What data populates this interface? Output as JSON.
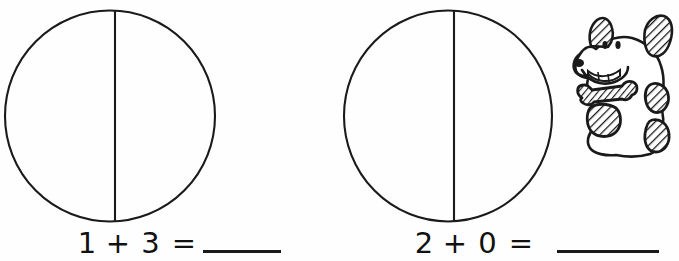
{
  "worksheet": {
    "background_color": "#fefefe",
    "ink_color": "#111111",
    "problems": [
      {
        "id": "problem-1",
        "shape": "circle-divided-in-half",
        "equation": {
          "addend_1": "1",
          "operator": "+",
          "addend_2": "3",
          "equals": "=",
          "answer": ""
        }
      },
      {
        "id": "problem-2",
        "shape": "circle-divided-in-half",
        "equation": {
          "addend_1": "2",
          "operator": "+",
          "addend_2": "0",
          "equals": "=",
          "answer": ""
        }
      }
    ],
    "illustration": {
      "name": "dog-with-bone",
      "description": "cartoon dog holding a bone"
    }
  }
}
